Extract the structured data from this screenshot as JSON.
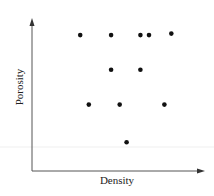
{
  "chart_data": {
    "type": "scatter",
    "title": "",
    "xlabel": "Density",
    "ylabel": "Porosity",
    "xlim": [
      0,
      10
    ],
    "ylim": [
      0,
      10
    ],
    "grid": false,
    "legend": null,
    "ticks": "none",
    "series": [
      {
        "name": "points",
        "color": "#111111",
        "points": [
          {
            "x": 2.8,
            "y": 9.0
          },
          {
            "x": 4.6,
            "y": 9.0
          },
          {
            "x": 6.3,
            "y": 9.0
          },
          {
            "x": 6.8,
            "y": 9.0
          },
          {
            "x": 8.1,
            "y": 9.1
          },
          {
            "x": 4.6,
            "y": 6.7
          },
          {
            "x": 6.3,
            "y": 6.7
          },
          {
            "x": 3.3,
            "y": 4.4
          },
          {
            "x": 5.1,
            "y": 4.4
          },
          {
            "x": 7.7,
            "y": 4.4
          },
          {
            "x": 5.5,
            "y": 1.9
          }
        ]
      }
    ]
  },
  "colors": {
    "axis": "#555555",
    "point": "#111111",
    "artifact_line": "#eeeeee"
  }
}
